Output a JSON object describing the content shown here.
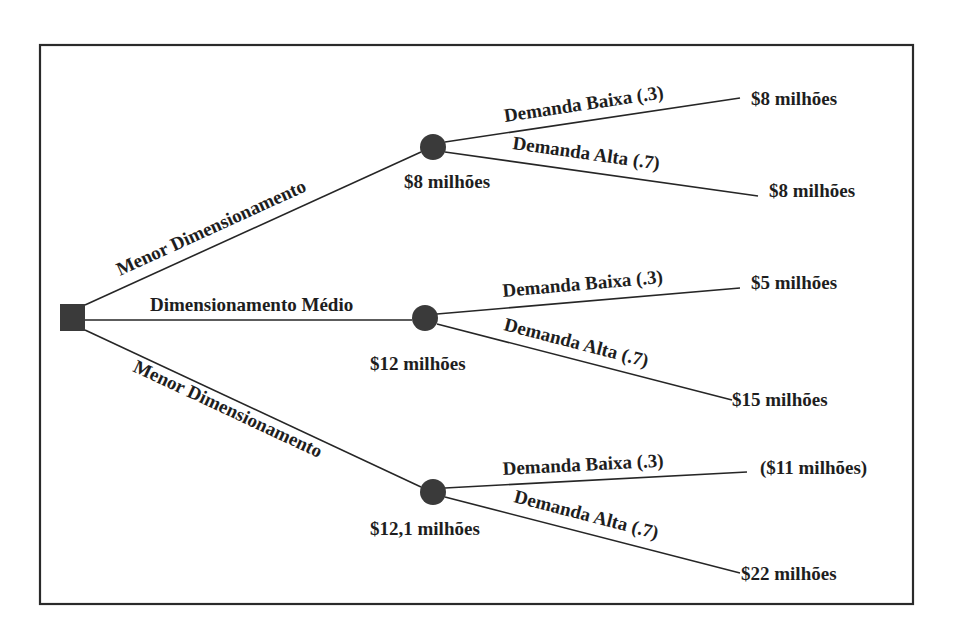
{
  "diagram": {
    "type": "decision-tree",
    "decision_node": {
      "shape": "square"
    },
    "branches": [
      {
        "label": "Menor Dimensionamento",
        "expected_value": "$8 milhões",
        "outcomes": [
          {
            "label": "Demanda Baixa (.3)",
            "value": "$8 milhões"
          },
          {
            "label": "Demanda Alta (.7)",
            "value": "$8 milhões"
          }
        ]
      },
      {
        "label": "Dimensionamento Médio",
        "expected_value": "$12 milhões",
        "outcomes": [
          {
            "label": "Demanda Baixa (.3)",
            "value": "$5 milhões"
          },
          {
            "label": "Demanda Alta (.7)",
            "value": "$15 milhões"
          }
        ]
      },
      {
        "label": "Menor Dimensionamento",
        "expected_value": "$12,1 milhões",
        "outcomes": [
          {
            "label": "Demanda Baixa (.3)",
            "value": "($11 milhões)"
          },
          {
            "label": "Demanda Alta (.7)",
            "value": "$22 milhões"
          }
        ]
      }
    ],
    "colors": {
      "line": "#262626",
      "node": "#3a3a3a",
      "text": "#1e1e1e",
      "background": "#ffffff"
    }
  }
}
